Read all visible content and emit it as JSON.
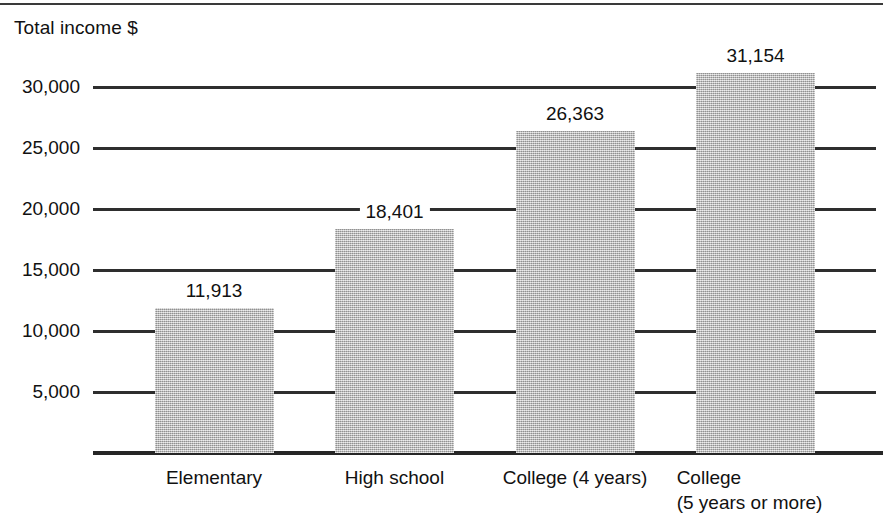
{
  "figure": {
    "axis_title": "Total income $"
  },
  "chart_data": {
    "type": "bar",
    "title": "",
    "xlabel": "",
    "ylabel": "Total income $",
    "categories": [
      "Elementary",
      "High school",
      "College (4 years)",
      "College (5 years or more)"
    ],
    "category_lines": [
      [
        "Elementary"
      ],
      [
        "High school"
      ],
      [
        "College (4 years)"
      ],
      [
        "College",
        "(5 years or more)"
      ]
    ],
    "values": [
      11913,
      18401,
      26363,
      31154
    ],
    "value_labels": [
      "11,913",
      "18,401",
      "26,363",
      "31,154"
    ],
    "ylim": [
      0,
      32500
    ],
    "yticks": [
      5000,
      10000,
      15000,
      20000,
      25000,
      30000
    ],
    "ytick_labels": [
      "5,000",
      "10,000",
      "15,000",
      "20,000",
      "25,000",
      "30,000"
    ],
    "grid": true,
    "legend": null,
    "bar_color": "#aaaaaa",
    "axis_color": "#262626"
  }
}
